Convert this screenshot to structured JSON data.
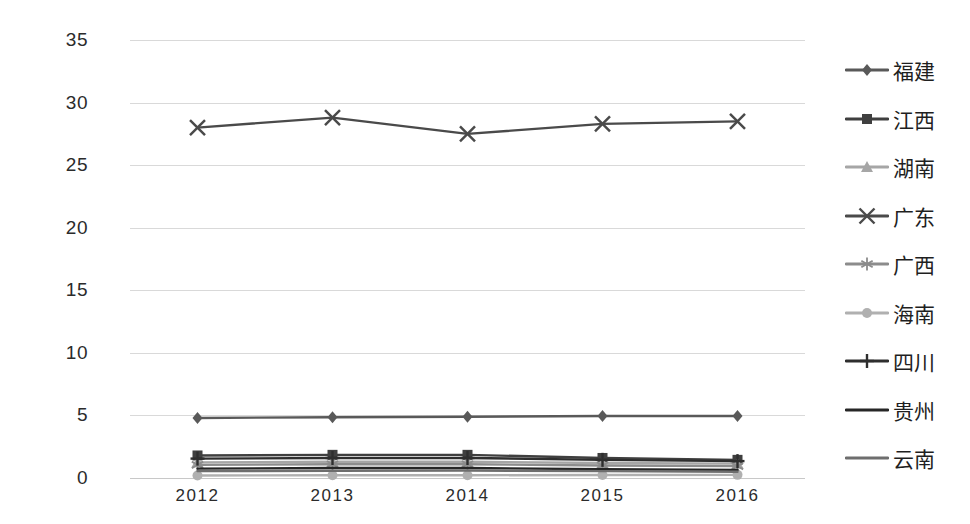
{
  "chart_data": {
    "type": "line",
    "title": "",
    "xlabel": "",
    "ylabel": "",
    "categories": [
      "2012",
      "2013",
      "2014",
      "2015",
      "2016"
    ],
    "x": [
      2012,
      2013,
      2014,
      2015,
      2016
    ],
    "ylim": [
      0,
      35
    ],
    "ytick_labels": [
      "0",
      "5",
      "10",
      "15",
      "20",
      "25",
      "30",
      "35"
    ],
    "ytick_values": [
      0,
      5,
      10,
      15,
      20,
      25,
      30,
      35
    ],
    "grid": true,
    "legend_position": "right",
    "series": [
      {
        "name": "福建",
        "marker": "diamond",
        "color": "#595959",
        "values": [
          4.8,
          4.85,
          4.9,
          4.95,
          4.95
        ]
      },
      {
        "name": "江西",
        "marker": "square",
        "color": "#3f3f3f",
        "values": [
          1.8,
          1.85,
          1.85,
          1.6,
          1.45
        ]
      },
      {
        "name": "湖南",
        "marker": "triangle",
        "color": "#a6a6a6",
        "values": [
          1.25,
          1.3,
          1.3,
          1.2,
          1.15
        ]
      },
      {
        "name": "广东",
        "marker": "x",
        "color": "#4a4a4a",
        "values": [
          28.0,
          28.8,
          27.5,
          28.3,
          28.5
        ]
      },
      {
        "name": "广西",
        "marker": "asterisk",
        "color": "#8c8c8c",
        "values": [
          1.05,
          1.1,
          1.1,
          1.0,
          0.95
        ]
      },
      {
        "name": "海南",
        "marker": "circle",
        "color": "#b0b0b0",
        "values": [
          0.2,
          0.22,
          0.22,
          0.24,
          0.25
        ]
      },
      {
        "name": "四川",
        "marker": "plus",
        "color": "#2e2e2e",
        "values": [
          1.55,
          1.6,
          1.6,
          1.45,
          1.35
        ]
      },
      {
        "name": "贵州",
        "marker": "none",
        "color": "#262626",
        "values": [
          0.75,
          0.8,
          0.8,
          0.7,
          0.65
        ]
      },
      {
        "name": "云南",
        "marker": "none",
        "color": "#6e6e6e",
        "values": [
          0.55,
          0.58,
          0.6,
          0.55,
          0.5
        ]
      }
    ]
  },
  "axes": {
    "x_labels": [
      "2012",
      "2013",
      "2014",
      "2015",
      "2016"
    ],
    "y_labels": [
      "35",
      "30",
      "25",
      "20",
      "15",
      "10",
      "5",
      "0"
    ]
  },
  "legend": {
    "items": [
      {
        "label": "福建",
        "marker": "diamond-marker-icon"
      },
      {
        "label": "江西",
        "marker": "square-marker-icon"
      },
      {
        "label": "湖南",
        "marker": "triangle-marker-icon"
      },
      {
        "label": "广东",
        "marker": "x-marker-icon"
      },
      {
        "label": "广西",
        "marker": "asterisk-marker-icon"
      },
      {
        "label": "海南",
        "marker": "circle-marker-icon"
      },
      {
        "label": "四川",
        "marker": "plus-marker-icon"
      },
      {
        "label": "贵州",
        "marker": "line-marker-icon"
      },
      {
        "label": "云南",
        "marker": "line-marker-icon"
      }
    ]
  }
}
